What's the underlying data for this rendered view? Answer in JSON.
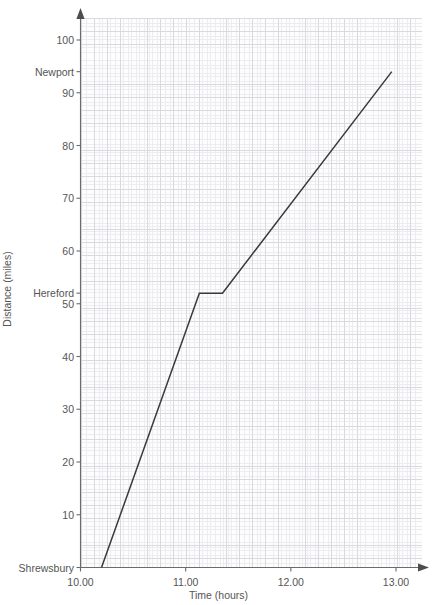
{
  "chart_data": {
    "type": "line",
    "title": "",
    "subtitle": "",
    "xlabel": "Time (hours)",
    "ylabel": "Distance (miles)",
    "xlim": [
      10.0,
      13.0
    ],
    "ylim": [
      0,
      103
    ],
    "grid": "graph-paper-minor-and-major",
    "legend_position": "none",
    "x_ticks": [
      {
        "value": 10.0,
        "label": "10.00"
      },
      {
        "value": 11.0,
        "label": "11.00"
      },
      {
        "value": 12.0,
        "label": "12.00"
      },
      {
        "value": 13.0,
        "label": "13.00"
      }
    ],
    "y_ticks": [
      {
        "value": 0,
        "label": "Shrewsbury"
      },
      {
        "value": 10,
        "label": "10"
      },
      {
        "value": 20,
        "label": "20"
      },
      {
        "value": 30,
        "label": "30"
      },
      {
        "value": 40,
        "label": "40"
      },
      {
        "value": 50,
        "label": "50"
      },
      {
        "value": 52,
        "label": "Hereford"
      },
      {
        "value": 60,
        "label": "60"
      },
      {
        "value": 70,
        "label": "70"
      },
      {
        "value": 80,
        "label": "80"
      },
      {
        "value": 90,
        "label": "90"
      },
      {
        "value": 94,
        "label": "Newport"
      },
      {
        "value": 100,
        "label": "100"
      }
    ],
    "series": [
      {
        "name": "Journey",
        "color": "#3a3a3a",
        "points": [
          {
            "x": 10.2,
            "y": 0
          },
          {
            "x": 11.13,
            "y": 52
          },
          {
            "x": 11.35,
            "y": 52
          },
          {
            "x": 12.96,
            "y": 94
          }
        ]
      }
    ],
    "annotations": [
      {
        "text": "Shrewsbury",
        "y": 0,
        "type": "y-axis-place-label"
      },
      {
        "text": "Hereford",
        "y": 52,
        "type": "y-axis-place-label"
      },
      {
        "text": "Newport",
        "y": 94,
        "type": "y-axis-place-label"
      }
    ],
    "colors": {
      "line": "#3a3a3a",
      "axis": "#6b6b6b",
      "grid_minor": "#ededf1",
      "grid_major": "#d9d9de",
      "text": "#555555",
      "plot_background": "#fdfdfd",
      "page_background": "#ffffff"
    }
  }
}
